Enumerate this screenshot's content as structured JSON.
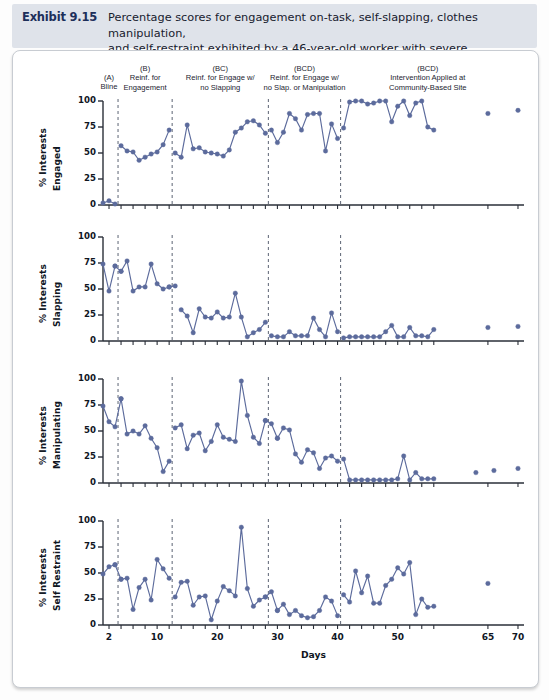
{
  "header": {
    "exhibit_label": "Exhibit 9.15",
    "title_line1": "Percentage scores for engagement on-task, self-slapping, clothes manipulation,",
    "title_line2": "and self-restraint exhibited by a 46-year-old worker with severe disabilities",
    "banner_color": "#dfe3ea",
    "label_color": "#1d2f5a"
  },
  "phases": [
    {
      "code": "(A)",
      "name": "Bline",
      "line2": "",
      "center_day": 2.0
    },
    {
      "code": "(B)",
      "name": "Reinf. for",
      "line2": "Engagement",
      "center_day": 8.0
    },
    {
      "code": "(BC)",
      "name": "Reinf. for Engage w/",
      "line2": "no Slapping",
      "center_day": 20.5
    },
    {
      "code": "(BCD)",
      "name": "Reinf. for Engage w/",
      "line2": "no Slap. or Manipulation",
      "center_day": 34.5
    },
    {
      "code": "(BCD)",
      "name": "Intervention Applied at",
      "line2": "Community-Based Site",
      "center_day": 55.0
    }
  ],
  "axis": {
    "x_title": "Days",
    "x_ticks": [
      2,
      10,
      20,
      30,
      40,
      50,
      65,
      70
    ],
    "x_minor_step": 2,
    "x_min": 1,
    "x_max": 71,
    "y_ticks": [
      0,
      25,
      50,
      75,
      100
    ],
    "y_min": 0,
    "y_max": 100,
    "phase_dividers": [
      3.5,
      12.5,
      28.5,
      40.5
    ]
  },
  "style": {
    "marker_color": "#5c6b9c",
    "line_color": "#5c6b9c",
    "divider_color": "#6b7280",
    "axis_color": "#2a2f38"
  },
  "chart_data": [
    {
      "type": "line",
      "title": "% Interests Engaged",
      "ylabel_line1": "% Interests",
      "ylabel_line2": "Engaged",
      "xlabel": "Days",
      "ylim": [
        0,
        100
      ],
      "segments": [
        {
          "x": [
            1,
            2,
            3
          ],
          "y": [
            2,
            4,
            1
          ]
        },
        {
          "x": [
            4,
            5,
            6,
            7,
            8,
            9,
            10,
            11,
            12
          ],
          "y": [
            57,
            52,
            51,
            43,
            46,
            49,
            51,
            58,
            72
          ]
        },
        {
          "x": [
            13,
            14,
            15,
            16,
            17,
            18,
            19,
            20,
            21,
            22,
            23,
            24,
            25,
            26,
            27,
            28
          ],
          "y": [
            50,
            46,
            77,
            54,
            55,
            51,
            50,
            49,
            47,
            53,
            70,
            74,
            80,
            81,
            77,
            69
          ]
        },
        {
          "x": [
            29,
            30,
            31,
            32,
            33,
            34,
            35,
            36,
            37,
            38,
            39,
            40
          ],
          "y": [
            72,
            60,
            70,
            88,
            83,
            72,
            87,
            88,
            88,
            52,
            78,
            64
          ]
        },
        {
          "x": [
            41,
            42,
            43,
            44,
            45,
            46,
            47,
            48,
            49,
            50,
            51,
            52,
            53,
            54,
            55,
            56
          ],
          "y": [
            74,
            99,
            100,
            100,
            97,
            98,
            100,
            100,
            80,
            95,
            100,
            86,
            98,
            100,
            75,
            72
          ]
        },
        {
          "x": [
            65
          ],
          "y": [
            88
          ]
        },
        {
          "x": [
            70
          ],
          "y": [
            91
          ]
        }
      ]
    },
    {
      "type": "line",
      "title": "% Interests Slapping",
      "ylabel_line1": "% Interests",
      "ylabel_line2": "Slapping",
      "xlabel": "Days",
      "ylim": [
        0,
        100
      ],
      "segments": [
        {
          "x": [
            1,
            2,
            3
          ],
          "y": [
            74,
            48,
            72
          ]
        },
        {
          "x": [
            3,
            4
          ],
          "y": [
            72,
            67
          ]
        },
        {
          "x": [
            4,
            5,
            6,
            7,
            8,
            9,
            10,
            11,
            12
          ],
          "y": [
            67,
            77,
            48,
            52,
            52,
            74,
            55,
            50,
            52
          ]
        },
        {
          "x": [
            12,
            13
          ],
          "y": [
            52,
            53
          ]
        },
        {
          "x": [
            14,
            15,
            16,
            17,
            18,
            19,
            20,
            21,
            22,
            23,
            24,
            25,
            26,
            27,
            28
          ],
          "y": [
            30,
            24,
            8,
            31,
            23,
            22,
            28,
            22,
            23,
            46,
            23,
            4,
            8,
            11,
            18
          ]
        },
        {
          "x": [
            29,
            30,
            31,
            32,
            33,
            34,
            35,
            36,
            37,
            38,
            39,
            40
          ],
          "y": [
            5,
            4,
            4,
            9,
            5,
            5,
            5,
            22,
            11,
            4,
            27,
            9
          ]
        },
        {
          "x": [
            41,
            42,
            43,
            44,
            45,
            46,
            47,
            48,
            49,
            50,
            51,
            52,
            53,
            54,
            55,
            56
          ],
          "y": [
            3,
            4,
            4,
            4,
            4,
            4,
            4,
            9,
            15,
            4,
            4,
            13,
            5,
            5,
            4,
            11
          ]
        },
        {
          "x": [
            65
          ],
          "y": [
            13
          ]
        },
        {
          "x": [
            70
          ],
          "y": [
            14
          ]
        }
      ]
    },
    {
      "type": "line",
      "title": "% Interests Manipulating",
      "ylabel_line1": "% Interests",
      "ylabel_line2": "Manipulating",
      "xlabel": "Days",
      "ylim": [
        0,
        100
      ],
      "segments": [
        {
          "x": [
            1,
            2,
            3,
            4
          ],
          "y": [
            74,
            59,
            54,
            81
          ]
        },
        {
          "x": [
            4,
            5,
            6,
            7,
            8,
            9,
            10,
            11,
            12
          ],
          "y": [
            81,
            47,
            50,
            47,
            55,
            43,
            34,
            11,
            21
          ]
        },
        {
          "x": [
            13,
            14,
            15,
            16,
            17,
            18,
            19,
            20,
            21,
            22,
            23,
            24,
            25,
            26,
            27,
            28
          ],
          "y": [
            53,
            56,
            33,
            46,
            48,
            31,
            40,
            56,
            44,
            42,
            40,
            98,
            65,
            44,
            38,
            60
          ]
        },
        {
          "x": [
            28,
            29,
            30
          ],
          "y": [
            60,
            57,
            43
          ]
        },
        {
          "x": [
            30,
            31,
            32,
            33,
            34,
            35,
            36,
            37,
            38,
            39,
            40
          ],
          "y": [
            43,
            53,
            51,
            28,
            20,
            32,
            29,
            14,
            24,
            26,
            21
          ]
        },
        {
          "x": [
            41,
            42,
            43,
            44,
            45,
            46,
            47,
            48,
            49,
            50,
            51,
            52,
            53,
            54,
            55,
            56
          ],
          "y": [
            23,
            3,
            3,
            3,
            3,
            3,
            3,
            3,
            3,
            4,
            26,
            3,
            10,
            4,
            4,
            4
          ]
        },
        {
          "x": [
            63
          ],
          "y": [
            10
          ]
        },
        {
          "x": [
            66
          ],
          "y": [
            12
          ]
        },
        {
          "x": [
            70
          ],
          "y": [
            14
          ]
        }
      ]
    },
    {
      "type": "line",
      "title": "% Interests Self Restraint",
      "ylabel_line1": "% Interests",
      "ylabel_line2": "Self Restraint",
      "xlabel": "Days",
      "ylim": [
        0,
        100
      ],
      "segments": [
        {
          "x": [
            1,
            2,
            3
          ],
          "y": [
            49,
            56,
            58
          ]
        },
        {
          "x": [
            3,
            4
          ],
          "y": [
            58,
            44
          ]
        },
        {
          "x": [
            4,
            5,
            6,
            7,
            8,
            9,
            10,
            11,
            12
          ],
          "y": [
            44,
            45,
            15,
            36,
            44,
            24,
            63,
            54,
            45
          ]
        },
        {
          "x": [
            13,
            14,
            15,
            16,
            17,
            18,
            19,
            20,
            21,
            22,
            23,
            24,
            25,
            26,
            27,
            28
          ],
          "y": [
            27,
            41,
            42,
            19,
            27,
            28,
            5,
            23,
            37,
            33,
            28,
            94,
            35,
            18,
            24,
            27
          ]
        },
        {
          "x": [
            28,
            29,
            30
          ],
          "y": [
            27,
            32,
            14
          ]
        },
        {
          "x": [
            30,
            31,
            32,
            33,
            34,
            35,
            36,
            37,
            38,
            39,
            40
          ],
          "y": [
            14,
            20,
            10,
            14,
            9,
            7,
            8,
            14,
            27,
            23,
            9
          ]
        },
        {
          "x": [
            41,
            42,
            43,
            44,
            45,
            46,
            47,
            48,
            49,
            50,
            51,
            52,
            53,
            54,
            55,
            56
          ],
          "y": [
            29,
            22,
            52,
            31,
            47,
            21,
            21,
            38,
            44,
            55,
            49,
            60,
            10,
            25,
            17,
            18
          ]
        },
        {
          "x": [
            65
          ],
          "y": [
            40
          ]
        }
      ]
    }
  ]
}
